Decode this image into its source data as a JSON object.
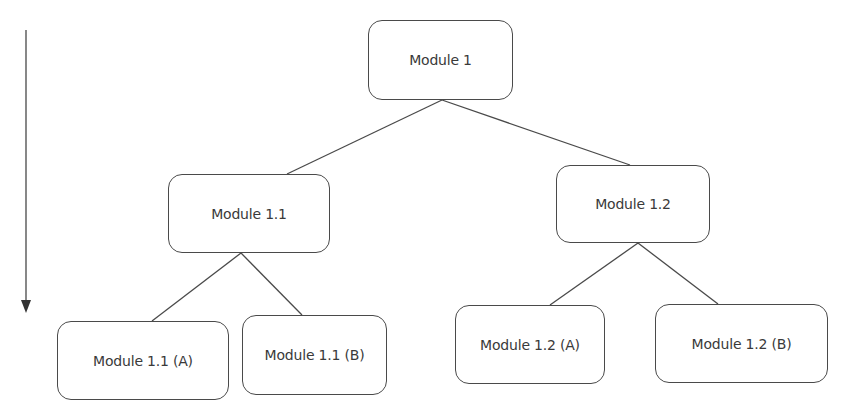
{
  "diagram": {
    "type": "hierarchy-tree",
    "direction_arrow": {
      "label": "",
      "direction": "down",
      "color": "#3a3a3a"
    },
    "line_color": "#4a4a4a",
    "nodes": [
      {
        "id": "m1",
        "label": "Module 1",
        "level": 0
      },
      {
        "id": "m11",
        "label": "Module 1.1",
        "level": 1,
        "parent": "m1"
      },
      {
        "id": "m12",
        "label": "Module 1.2",
        "level": 1,
        "parent": "m1"
      },
      {
        "id": "m11a",
        "label": "Module 1.1 (A)",
        "level": 2,
        "parent": "m11"
      },
      {
        "id": "m11b",
        "label": "Module 1.1 (B)",
        "level": 2,
        "parent": "m11"
      },
      {
        "id": "m12a",
        "label": "Module 1.2 (A)",
        "level": 2,
        "parent": "m12"
      },
      {
        "id": "m12b",
        "label": "Module 1.2 (B)",
        "level": 2,
        "parent": "m12"
      }
    ],
    "edges": [
      [
        "m1",
        "m11"
      ],
      [
        "m1",
        "m12"
      ],
      [
        "m11",
        "m11a"
      ],
      [
        "m11",
        "m11b"
      ],
      [
        "m12",
        "m12a"
      ],
      [
        "m12",
        "m12b"
      ]
    ]
  }
}
